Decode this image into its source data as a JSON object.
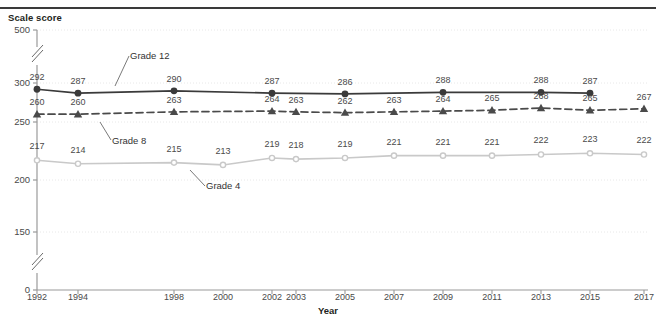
{
  "axes": {
    "y_title": "Scale score",
    "x_title": "Year"
  },
  "annotations": {
    "grade12": "Grade 12",
    "grade8": "Grade 8",
    "grade4": "Grade 4"
  },
  "colors": {
    "grade12": "#3a3a3a",
    "grade8": "#4a4a4a",
    "grade4": "#c9c9c9",
    "axis": "#9a9a9a",
    "grid": "#e2e2e2",
    "text": "#4a4a4a"
  },
  "chart_data": {
    "type": "line",
    "title": "",
    "xlabel": "Year",
    "ylabel": "Scale score",
    "grid": true,
    "legend": "inline-annotations",
    "ylim": [
      0,
      500
    ],
    "yticks": [
      0,
      150,
      200,
      250,
      300,
      500
    ],
    "y_axis_breaks": [
      {
        "between": [
          0,
          150
        ]
      },
      {
        "between": [
          300,
          500
        ]
      }
    ],
    "x": [
      1992,
      1994,
      1998,
      2000,
      2002,
      2003,
      2005,
      2007,
      2009,
      2011,
      2013,
      2015,
      2017
    ],
    "xticklabels": [
      "1992",
      "1994",
      "1998",
      "2000",
      "2002",
      "2003",
      "2005",
      "2007",
      "2009",
      "2011",
      "2013",
      "2015",
      "2017"
    ],
    "series": [
      {
        "name": "Grade 12",
        "marker": "circle",
        "linestyle": "solid",
        "color": "#3a3a3a",
        "points": [
          {
            "x": 1992,
            "y": 292
          },
          {
            "x": 1994,
            "y": 287
          },
          {
            "x": 1998,
            "y": 290
          },
          {
            "x": 2002,
            "y": 287
          },
          {
            "x": 2005,
            "y": 286
          },
          {
            "x": 2009,
            "y": 288
          },
          {
            "x": 2013,
            "y": 288
          },
          {
            "x": 2015,
            "y": 287
          }
        ]
      },
      {
        "name": "Grade 8",
        "marker": "triangle",
        "linestyle": "dashed",
        "color": "#4a4a4a",
        "points": [
          {
            "x": 1992,
            "y": 260
          },
          {
            "x": 1994,
            "y": 260
          },
          {
            "x": 1998,
            "y": 263
          },
          {
            "x": 2002,
            "y": 264
          },
          {
            "x": 2003,
            "y": 263
          },
          {
            "x": 2005,
            "y": 262
          },
          {
            "x": 2007,
            "y": 263
          },
          {
            "x": 2009,
            "y": 264
          },
          {
            "x": 2011,
            "y": 265
          },
          {
            "x": 2013,
            "y": 268
          },
          {
            "x": 2015,
            "y": 265
          },
          {
            "x": 2017,
            "y": 267
          }
        ]
      },
      {
        "name": "Grade 4",
        "marker": "circle-open",
        "linestyle": "solid",
        "color": "#c9c9c9",
        "points": [
          {
            "x": 1992,
            "y": 217
          },
          {
            "x": 1994,
            "y": 214
          },
          {
            "x": 1998,
            "y": 215
          },
          {
            "x": 2000,
            "y": 213
          },
          {
            "x": 2002,
            "y": 219
          },
          {
            "x": 2003,
            "y": 218
          },
          {
            "x": 2005,
            "y": 219
          },
          {
            "x": 2007,
            "y": 221
          },
          {
            "x": 2009,
            "y": 221
          },
          {
            "x": 2011,
            "y": 221
          },
          {
            "x": 2013,
            "y": 222
          },
          {
            "x": 2015,
            "y": 223
          },
          {
            "x": 2017,
            "y": 222
          }
        ]
      }
    ]
  }
}
